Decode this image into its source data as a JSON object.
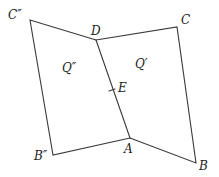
{
  "diagram": {
    "type": "geometric-figure",
    "stroke_color": "#3a3a3a",
    "label_color": "#222222",
    "points": {
      "C2": {
        "label": "C″",
        "x": 30,
        "y": 20
      },
      "D": {
        "label": "D",
        "x": 96,
        "y": 40
      },
      "C": {
        "label": "C",
        "x": 177,
        "y": 27
      },
      "B": {
        "label": "B",
        "x": 196,
        "y": 163
      },
      "A": {
        "label": "A",
        "x": 130,
        "y": 138
      },
      "B2": {
        "label": "B″",
        "x": 53,
        "y": 155
      },
      "E": {
        "label": "E",
        "x": 112,
        "y": 90
      }
    },
    "regions": {
      "Q2": {
        "label": "Q″"
      },
      "Q1": {
        "label": "Q′"
      }
    },
    "edges": [
      [
        "C2",
        "D"
      ],
      [
        "D",
        "C"
      ],
      [
        "C",
        "B"
      ],
      [
        "B",
        "A"
      ],
      [
        "A",
        "B2"
      ],
      [
        "B2",
        "C2"
      ],
      [
        "D",
        "A"
      ]
    ]
  }
}
